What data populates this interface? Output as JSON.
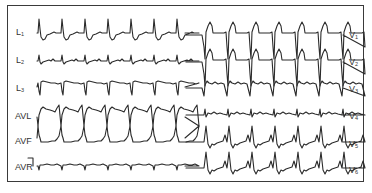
{
  "figure": {
    "type": "12-lead ECG tracing",
    "colors": {
      "trace": "#2b2b2b",
      "border": "#3a3a3a",
      "background": "#ffffff"
    }
  },
  "limb_leads": [
    {
      "id": "L1",
      "label": "L",
      "sub": "1",
      "baseline": 33,
      "shape": "tall_r"
    },
    {
      "id": "L2",
      "label": "L",
      "sub": "2",
      "baseline": 61,
      "shape": "small_r"
    },
    {
      "id": "L3",
      "label": "L",
      "sub": "3",
      "baseline": 87,
      "shape": "deep_s"
    },
    {
      "id": "AVL",
      "label": "AVL",
      "sub": "",
      "baseline": 117,
      "shape": "wide_up"
    },
    {
      "id": "AVF",
      "label": "AVF",
      "sub": "",
      "baseline": 138,
      "shape": "wide_down"
    },
    {
      "id": "AVR",
      "label": "AVR",
      "sub": "",
      "baseline": 166,
      "shape": "small_neg"
    }
  ],
  "chest_leads": [
    {
      "id": "V1",
      "label": "V",
      "sub": "1",
      "baseline": 35,
      "shape": "deep_qs_st_up"
    },
    {
      "id": "V2",
      "label": "V",
      "sub": "2",
      "baseline": 62,
      "shape": "deep_qs_st_up"
    },
    {
      "id": "V3",
      "label": "V",
      "sub": "3",
      "baseline": 88,
      "shape": "rs_small"
    },
    {
      "id": "V4",
      "label": "V",
      "sub": "4",
      "baseline": 115,
      "shape": "small_flat"
    },
    {
      "id": "V5",
      "label": "V",
      "sub": "5",
      "baseline": 142,
      "shape": "tall_r_st_down"
    },
    {
      "id": "V6",
      "label": "V",
      "sub": "6",
      "baseline": 168,
      "shape": "tall_r_st_down"
    }
  ],
  "beats": {
    "limb_x": [
      38,
      61,
      84,
      107,
      130,
      153,
      176
    ],
    "chest_x": [
      204,
      227,
      250,
      273,
      296,
      319,
      342
    ]
  }
}
